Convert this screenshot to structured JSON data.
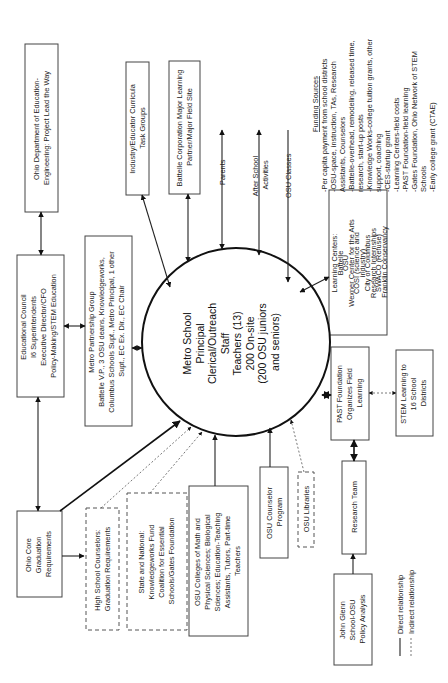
{
  "diagram": {
    "orientation": "rotated 90 degrees counter-clockwise",
    "center": {
      "lines": [
        "Metro School",
        "Principal",
        "Clerical/Outreach",
        "Staff",
        "Teachers (13)",
        "200 On-site",
        "(200 OSU juniors",
        "and seniors)"
      ]
    },
    "nodes": {
      "ohio_dept": {
        "lines": [
          "Ohio Department of Education-",
          "Engineering: Project Lead the Way"
        ]
      },
      "industry": {
        "lines": [
          "Industry/Educator Curricula",
          "Task Groups"
        ]
      },
      "battelle": {
        "lines": [
          "Battelle Corporation Major Learning",
          "Partner/Major Field Site"
        ]
      },
      "parents": {
        "lines": [
          "Parents"
        ]
      },
      "after_school": {
        "lines": [
          "After School",
          "Activities"
        ]
      },
      "osu_classes": {
        "lines": [
          "OSU Classes"
        ]
      },
      "educational_council": {
        "lines": [
          "Educational Council",
          "I6 Superintendents",
          "Executive Director/CFO",
          "Policy-Making/STEM Education"
        ]
      },
      "metro_partnership": {
        "lines": [
          "Metro Partnership Group",
          "Battelle V.P., 3 OSU deans, Knowledgeworks,",
          "Columbus Schools Supt., Metro Principal, 1 other",
          "Supt., EC Ex. Dir., EC Chair"
        ]
      },
      "learning_centers": {
        "lines": [
          "Learning Centers:",
          "Battelle",
          "OSU",
          "Wexner Center for the Arts",
          "COSI (science and",
          "industry)",
          "City of Columbus",
          "Research Internships",
          "SWACO (Refuse)",
          "Franklin Conservancy"
        ]
      },
      "past_foundation": {
        "lines": [
          "PAST Foundation",
          "Organizes Field",
          "Learning"
        ]
      },
      "stem_learning": {
        "lines": [
          "STEM Learning to",
          "16 School",
          "Districts"
        ]
      },
      "ohio_core": {
        "lines": [
          "Ohio Core",
          "Graduation",
          "Requirements"
        ]
      },
      "hs_counselors": {
        "lines": [
          "High School Counselors:",
          "Graduation Requirements"
        ]
      },
      "state_national": {
        "lines": [
          "State and National:",
          "Knowledgeworks Fund",
          "Coalition for Essential",
          "Schools/Gates Foundation"
        ]
      },
      "osu_colleges": {
        "lines": [
          "OSU Colleges of Math and",
          "Physical Sciences; Biological",
          "Sciences; Education-Teaching",
          "Assistants, Tutors, Part-time",
          "Teachers"
        ]
      },
      "osu_counselor": {
        "lines": [
          "OSU Counselor",
          "Program"
        ]
      },
      "osu_libraries": {
        "lines": [
          "OSU Libraries"
        ]
      },
      "research_team": {
        "lines": [
          "Research Team"
        ]
      },
      "john_glenn": {
        "lines": [
          "John Glenn",
          "School-OSU",
          "Policy Analysis"
        ]
      }
    },
    "funding": {
      "title": "Funding Sources",
      "items": [
        "-Per capita payment from school districts",
        "-OSU-space, instruction, TAs, Research",
        "  Assistants, Counselors",
        "-Battelle-overhead, remodeling, released time,",
        "  research, start-up posts",
        "-Knowledge Works-college tuition grants, other",
        "  support, coaching",
        "-CES-startup grant",
        "-Learning Centers-field costs",
        "-PAST Foundation-field learning",
        "-Gates Foundation, Ohio Network of STEM",
        "  Schools",
        "-Early college grant (CTAE)"
      ]
    },
    "legend": {
      "direct": "Direct relationship",
      "indirect": "Indirect relationship"
    },
    "colors": {
      "stroke": "#222222",
      "box_border": "#444444",
      "background": "#ffffff"
    }
  }
}
